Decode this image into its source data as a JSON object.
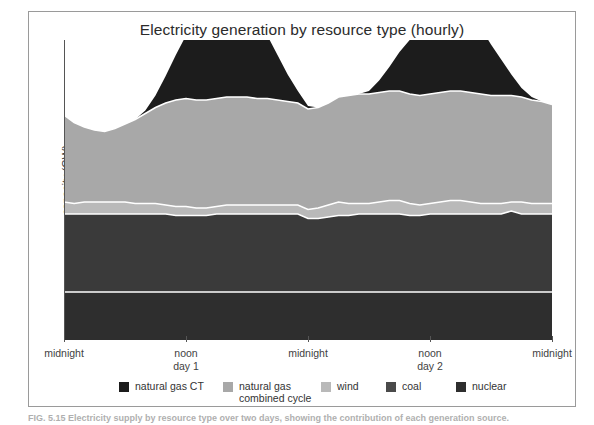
{
  "figure": {
    "title": "Electricity generation by resource type (hourly)",
    "y_axis_label": "capacity (GW)",
    "caption": "FIG. 5.15   Electricity supply by resource type over two days, showing the contribution of each generation source."
  },
  "x_axis": {
    "ticks": [
      {
        "primary": "midnight",
        "secondary": ""
      },
      {
        "primary": "noon",
        "secondary": "day 1"
      },
      {
        "primary": "midnight",
        "secondary": ""
      },
      {
        "primary": "noon",
        "secondary": "day 2"
      },
      {
        "primary": "midnight",
        "secondary": ""
      }
    ]
  },
  "legend": {
    "items": [
      {
        "label": "natural gas CT",
        "label_line2": "",
        "color": "#1c1c1c"
      },
      {
        "label": "natural gas",
        "label_line2": "combined cycle",
        "color": "#a8a8a8"
      },
      {
        "label": "wind",
        "label_line2": "",
        "color": "#b9b9b9"
      },
      {
        "label": "coal",
        "label_line2": "",
        "color": "#4a4a4a"
      },
      {
        "label": "nuclear",
        "label_line2": "",
        "color": "#2e2e2e"
      }
    ]
  },
  "colors": {
    "natural_gas_ct": "#1c1c1c",
    "natural_gas_combined_cycle": "#a8a8a8",
    "wind": "#b9b9b9",
    "coal": "#3a3a3a",
    "nuclear": "#2e2e2e",
    "separator": "#ffffff",
    "axis": "#555555",
    "panel_border": "#9a9a9a",
    "background": "#ffffff"
  },
  "chart_data": {
    "type": "area",
    "stacked": true,
    "title": "Electricity generation by resource type (hourly)",
    "xlabel": "",
    "ylabel": "capacity (GW)",
    "grid": false,
    "legend_position": "bottom",
    "x_tick_labels": [
      "midnight",
      "noon day 1",
      "midnight",
      "noon day 2",
      "midnight"
    ],
    "x_tick_positions": [
      0,
      12,
      24,
      36,
      48
    ],
    "x": [
      0,
      1,
      2,
      3,
      4,
      5,
      6,
      7,
      8,
      9,
      10,
      11,
      12,
      13,
      14,
      15,
      16,
      17,
      18,
      19,
      20,
      21,
      22,
      23,
      24,
      25,
      26,
      27,
      28,
      29,
      30,
      31,
      32,
      33,
      34,
      35,
      36,
      37,
      38,
      39,
      40,
      41,
      42,
      43,
      44,
      45,
      46,
      47,
      48
    ],
    "xlim": [
      0,
      48
    ],
    "ylim": [
      0,
      100
    ],
    "series": [
      {
        "name": "nuclear",
        "color": "#2e2e2e",
        "values": [
          16,
          16,
          16,
          16,
          16,
          16,
          16,
          16,
          16,
          16,
          16,
          16,
          16,
          16,
          16,
          16,
          16,
          16,
          16,
          16,
          16,
          16,
          16,
          16,
          16,
          16,
          16,
          16,
          16,
          16,
          16,
          16,
          16,
          16,
          16,
          16,
          16,
          16,
          16,
          16,
          16,
          16,
          16,
          16,
          16,
          16,
          16,
          16,
          16
        ]
      },
      {
        "name": "coal",
        "color": "#3a3a3a",
        "values": [
          26,
          26,
          26,
          26,
          26,
          26,
          26,
          26,
          26,
          26,
          26,
          25.5,
          25.5,
          25.5,
          25.5,
          26,
          26,
          26,
          26,
          26,
          26,
          26,
          26,
          26,
          24.5,
          24.5,
          25,
          25.5,
          25.5,
          26,
          26,
          26,
          26,
          26,
          25.5,
          25.5,
          26,
          26,
          26,
          26,
          26,
          26,
          26,
          26,
          27,
          26,
          26,
          26,
          26
        ]
      },
      {
        "name": "wind",
        "color": "#b9b9b9",
        "values": [
          4,
          3.5,
          4,
          4,
          4,
          4,
          4,
          3.5,
          3.5,
          3.5,
          3,
          3,
          3,
          2.5,
          2.5,
          2.5,
          3,
          3,
          3,
          3,
          3,
          3,
          3,
          3,
          3,
          3.5,
          4,
          4.5,
          4,
          3.5,
          3.5,
          4,
          4.5,
          4.5,
          4,
          3.5,
          3.5,
          4,
          4.5,
          4.5,
          4,
          3.5,
          3.5,
          3.5,
          3,
          4,
          3.5,
          3.5,
          3.5
        ]
      },
      {
        "name": "natural gas combined cycle",
        "color": "#a8a8a8",
        "values": [
          29,
          27,
          25,
          24,
          23.5,
          24.5,
          26,
          28,
          30,
          32,
          34,
          35.5,
          36,
          36,
          36,
          36,
          36,
          36,
          36,
          35.5,
          35.5,
          35,
          34.5,
          34,
          33.5,
          33.5,
          34,
          35,
          36,
          36.5,
          36.5,
          36.5,
          36.5,
          36.5,
          36.5,
          36.5,
          36.5,
          36.5,
          36.5,
          36.5,
          36.5,
          36.5,
          36,
          36,
          35.5,
          35,
          34.5,
          34,
          33
        ]
      },
      {
        "name": "natural gas CT",
        "color": "#1c1c1c",
        "values": [
          0,
          0,
          0,
          0,
          0,
          0,
          0,
          0,
          1,
          4,
          9,
          15,
          21,
          26,
          30,
          32,
          33,
          32,
          30,
          26,
          21,
          15,
          9,
          4,
          1,
          0,
          0,
          0,
          0,
          0,
          1,
          4,
          8,
          13,
          18,
          23,
          26,
          28,
          29,
          28,
          26,
          22,
          17,
          12,
          7,
          3,
          1,
          0,
          0
        ]
      }
    ]
  }
}
